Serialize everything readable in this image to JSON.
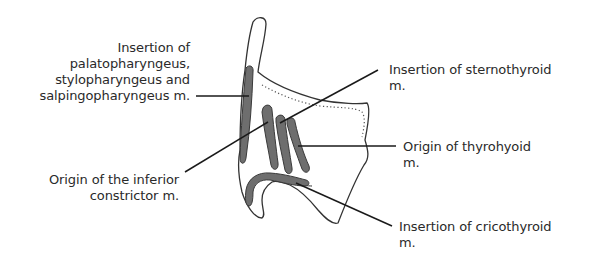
{
  "diagram": {
    "colors": {
      "outline": "#333333",
      "muscle_fill": "#6e6e6e",
      "leader_line": "#1a1a1a",
      "text": "#2a2a2a",
      "background": "#ffffff"
    },
    "labels": {
      "palatopharyngeus": {
        "lines": [
          "Insertion of",
          "palatopharyngeus,",
          "stylopharyngeus and",
          "salpingopharyngeus m."
        ]
      },
      "inferior_constrictor": {
        "lines": [
          "Origin of the inferior",
          "constrictor m."
        ]
      },
      "sternothyroid": {
        "lines": [
          "Insertion of sternothyroid",
          "m."
        ]
      },
      "thyrohyoid": {
        "lines": [
          "Origin of thyrohyoid",
          "m."
        ]
      },
      "cricothyroid": {
        "lines": [
          "Insertion of cricothyroid",
          "m."
        ]
      }
    }
  }
}
